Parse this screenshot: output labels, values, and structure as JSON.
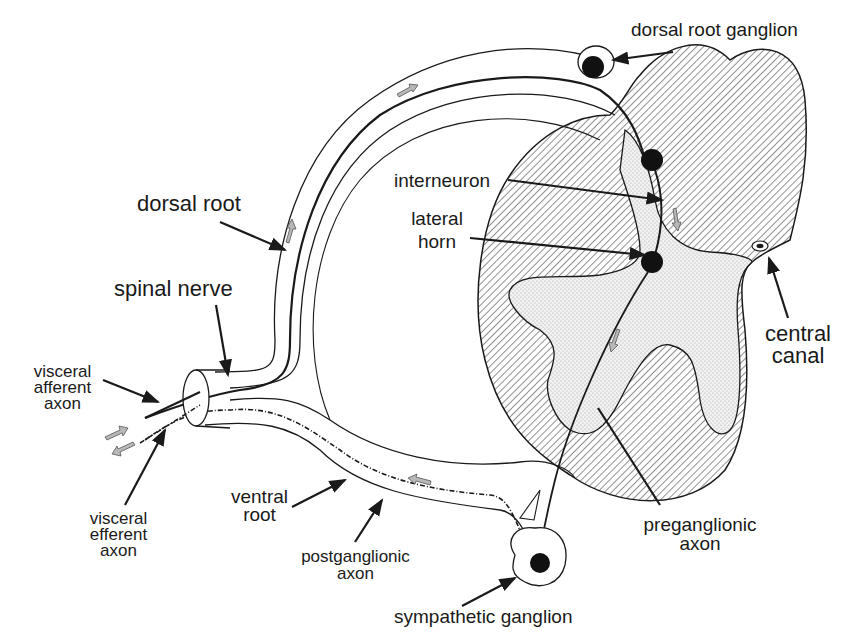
{
  "diagram": {
    "labels": {
      "dorsal_root_ganglion": "dorsal root ganglion",
      "interneuron": "interneuron",
      "lateral_horn_line1": "lateral",
      "lateral_horn_line2": "horn",
      "dorsal_root": "dorsal root",
      "spinal_nerve": "spinal nerve",
      "visceral_afferent_line1": "visceral",
      "visceral_afferent_line2": "afferent",
      "visceral_afferent_line3": "axon",
      "visceral_efferent_line1": "visceral",
      "visceral_efferent_line2": "efferent",
      "visceral_efferent_line3": "axon",
      "ventral_root_line1": "ventral",
      "ventral_root_line2": "root",
      "postganglionic_line1": "postganglionic",
      "postganglionic_line2": "axon",
      "sympathetic_ganglion": "sympathetic ganglion",
      "preganglionic_line1": "preganglionic",
      "preganglionic_line2": "axon",
      "central_canal_line1": "central",
      "central_canal_line2": "canal"
    },
    "colors": {
      "ink": "#1a1a1a",
      "white_matter_hatch": "#555555",
      "gray_matter_stipple": "#d8d8d8",
      "arrow_fill": "#b8b8b8",
      "neuron_body": "#111111"
    }
  }
}
